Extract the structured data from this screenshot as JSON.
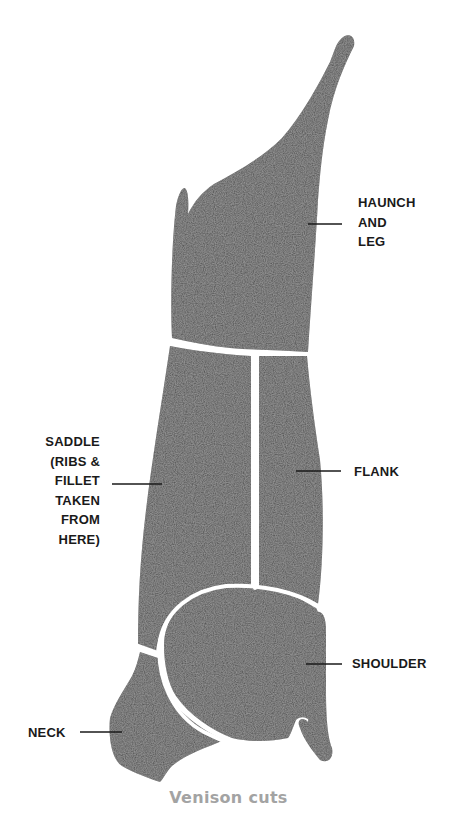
{
  "diagram": {
    "title": "Venison cuts",
    "cuts": [
      {
        "id": "haunch",
        "label_lines": [
          "HAUNCH",
          "AND",
          "LEG"
        ]
      },
      {
        "id": "saddle",
        "label_lines": [
          "SADDLE",
          "(RIBS &",
          "FILLET",
          "TAKEN",
          "FROM",
          "HERE)"
        ]
      },
      {
        "id": "flank",
        "label_lines": [
          "FLANK"
        ]
      },
      {
        "id": "shoulder",
        "label_lines": [
          "SHOULDER"
        ]
      },
      {
        "id": "neck",
        "label_lines": [
          "NECK"
        ]
      }
    ],
    "colors": {
      "meat": "#4a4a4a",
      "divider": "#ffffff",
      "label": "#1a1a1a",
      "caption": "#a3a3a3"
    }
  }
}
